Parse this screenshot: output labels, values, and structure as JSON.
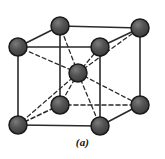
{
  "figure": {
    "caption": "(a)",
    "background_color": "#ffffff"
  },
  "style": {
    "atom_fill": "#4a4a4a",
    "atom_fill_light": "#6e6e6e",
    "atom_stroke": "#1a1a1a",
    "atom_radius": 9,
    "edge_color": "#2a2a2a",
    "edge_width": 1.6,
    "hidden_edge_color": "#2a2a2a",
    "hidden_edge_dash": "4,3",
    "bond_color": "#2a2a2a",
    "bond_dash": "4,3"
  },
  "structure": {
    "type": "bcc",
    "name": "Body-centered cubic",
    "atom_count": 9,
    "corner_atom_count": 8,
    "center_atom_count": 1,
    "atoms": [
      {
        "id": "corner-back-top-left",
        "label": "back top left",
        "x": 18,
        "y": 47,
        "kind": "corner",
        "hidden": false
      },
      {
        "id": "corner-back-top-right",
        "label": "back top right",
        "x": 140,
        "y": 28,
        "kind": "corner",
        "hidden": false
      },
      {
        "id": "corner-top-back-center",
        "label": "top back",
        "x": 60,
        "y": 26,
        "kind": "corner",
        "hidden": false
      },
      {
        "id": "corner-front-top-right",
        "label": "front top right",
        "x": 100,
        "y": 47,
        "kind": "corner",
        "hidden": false
      },
      {
        "id": "corner-back-bottom-left",
        "label": "back bottom left",
        "x": 60,
        "y": 105,
        "kind": "corner",
        "hidden": true
      },
      {
        "id": "corner-back-bottom-right",
        "label": "back bottom right",
        "x": 140,
        "y": 105,
        "kind": "corner",
        "hidden": false
      },
      {
        "id": "corner-front-bottom-left",
        "label": "front bottom left",
        "x": 18,
        "y": 125,
        "kind": "corner",
        "hidden": false
      },
      {
        "id": "corner-front-bottom-right",
        "label": "front bottom right",
        "x": 100,
        "y": 126,
        "kind": "corner",
        "hidden": false
      },
      {
        "id": "atom-body-center",
        "label": "body center",
        "x": 78,
        "y": 73,
        "kind": "center",
        "hidden": false
      }
    ],
    "solid_edges": [
      {
        "from": "corner-top-back-center",
        "to": "corner-back-top-right"
      },
      {
        "from": "corner-top-back-center",
        "to": "corner-back-top-left"
      },
      {
        "from": "corner-back-top-left",
        "to": "corner-front-top-right"
      },
      {
        "from": "corner-front-top-right",
        "to": "corner-back-top-right"
      },
      {
        "from": "corner-back-top-left",
        "to": "corner-front-bottom-left"
      },
      {
        "from": "corner-back-top-right",
        "to": "corner-back-bottom-right"
      },
      {
        "from": "corner-front-top-right",
        "to": "corner-front-bottom-right"
      },
      {
        "from": "corner-front-bottom-left",
        "to": "corner-front-bottom-right"
      },
      {
        "from": "corner-front-bottom-right",
        "to": "corner-back-bottom-right"
      },
      {
        "from": "corner-top-back-center",
        "to": "corner-back-bottom-left"
      }
    ],
    "hidden_edges": [
      {
        "from": "corner-back-bottom-left",
        "to": "corner-front-bottom-left"
      },
      {
        "from": "corner-back-bottom-left",
        "to": "corner-back-bottom-right"
      }
    ],
    "center_bonds": [
      {
        "from": "atom-body-center",
        "to": "corner-top-back-center"
      },
      {
        "from": "atom-body-center",
        "to": "corner-back-top-left"
      },
      {
        "from": "atom-body-center",
        "to": "corner-back-top-right"
      },
      {
        "from": "atom-body-center",
        "to": "corner-front-top-right"
      },
      {
        "from": "atom-body-center",
        "to": "corner-back-bottom-left"
      },
      {
        "from": "atom-body-center",
        "to": "corner-back-bottom-right"
      },
      {
        "from": "atom-body-center",
        "to": "corner-front-bottom-left"
      },
      {
        "from": "atom-body-center",
        "to": "corner-front-bottom-right"
      }
    ]
  }
}
